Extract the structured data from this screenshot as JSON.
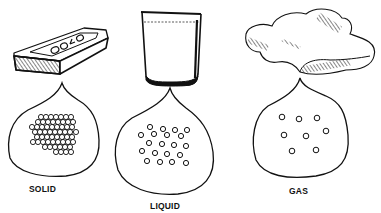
{
  "diagram": {
    "topic": "States of matter",
    "panels": [
      {
        "id": "solid",
        "label": "SOLID",
        "object": "gold-bar",
        "object_text": "GOLD",
        "particle_arrangement": "tightly packed, touching, ordered",
        "particle_count_approx": 60
      },
      {
        "id": "liquid",
        "label": "LIQUID",
        "object": "glass-of-liquid",
        "particle_arrangement": "close but loosely arranged",
        "particle_count_approx": 22
      },
      {
        "id": "gas",
        "label": "GAS",
        "object": "cloud",
        "particle_arrangement": "widely spaced",
        "particle_count_approx": 8
      }
    ],
    "colors": {
      "ink": "#111111",
      "background": "#ffffff"
    }
  }
}
